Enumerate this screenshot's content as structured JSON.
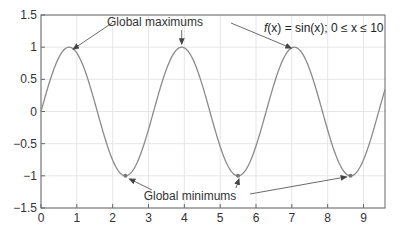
{
  "chart_data": {
    "type": "line",
    "title": "",
    "xlabel": "",
    "ylabel": "",
    "xlim": [
      0,
      9.6
    ],
    "ylim": [
      -1.5,
      1.5
    ],
    "x_ticks": [
      0,
      1,
      2,
      3,
      4,
      5,
      6,
      7,
      8,
      9
    ],
    "y_ticks": [
      -1.5,
      -1,
      -0.5,
      0,
      0.5,
      1,
      1.5
    ],
    "y_tick_labels": [
      "−1.5",
      "−1",
      "−0.5",
      "0",
      "0.5",
      "1",
      "1.5"
    ],
    "grid": true,
    "legend": null,
    "series": [
      {
        "name": "f(x)",
        "color": "#8a8a8a",
        "x": [
          0,
          0.4,
          0.785,
          1.2,
          1.57,
          2.0,
          2.356,
          2.7,
          3.14,
          3.5,
          3.927,
          4.3,
          4.712,
          5.1,
          5.498,
          5.9,
          6.283,
          6.7,
          7.069,
          7.4,
          7.854,
          8.2,
          8.639,
          9.0,
          9.425,
          9.6
        ],
        "values": [
          0,
          0.72,
          1.0,
          0.68,
          0.0,
          -0.76,
          -1.0,
          -0.77,
          0.0,
          0.66,
          1.0,
          0.73,
          0.0,
          -0.7,
          -1.0,
          -0.69,
          0.0,
          0.79,
          1.0,
          0.77,
          0.0,
          -0.79,
          -1.0,
          -0.75,
          0.0,
          0.35
        ]
      }
    ],
    "maxima": [
      {
        "x": 0.785,
        "y": 1
      },
      {
        "x": 3.927,
        "y": 1
      },
      {
        "x": 7.069,
        "y": 1
      }
    ],
    "minima": [
      {
        "x": 2.356,
        "y": -1
      },
      {
        "x": 5.498,
        "y": -1
      },
      {
        "x": 8.639,
        "y": -1
      }
    ],
    "annotations": [
      {
        "text": "Global maximums",
        "points_to": "maxima"
      },
      {
        "text": "Global minimums",
        "points_to": "minima"
      },
      {
        "text": "f(x) = sin(x); 0 ≤ x ≤ 10",
        "position": "top-right"
      }
    ]
  },
  "labels": {
    "max_annotation": "Global maximums",
    "min_annotation": "Global minimums",
    "formula_fx": "f",
    "formula_rest": "(x) = sin(x); 0 ≤ x ≤ 10"
  }
}
